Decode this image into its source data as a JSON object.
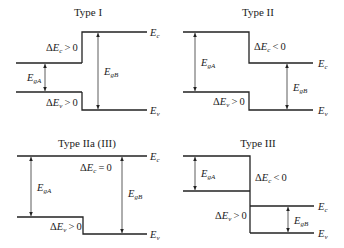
{
  "panels": [
    {
      "id": "type-i",
      "title": "Type I",
      "title_pos": [
        88,
        16
      ],
      "bands": [
        {
          "name": "ec-left",
          "points": [
            [
              16,
              63
            ],
            [
              82,
              63
            ]
          ]
        },
        {
          "name": "ec-step",
          "points": [
            [
              82,
              63
            ],
            [
              82,
              32
            ],
            [
              147,
              32
            ]
          ]
        },
        {
          "name": "ev-left",
          "points": [
            [
              16,
              92
            ],
            [
              82,
              92
            ]
          ]
        },
        {
          "name": "ev-step",
          "points": [
            [
              82,
              92
            ],
            [
              82,
              110
            ],
            [
              147,
              110
            ]
          ]
        }
      ],
      "arrows": [
        {
          "name": "egA-arrow",
          "x": 45,
          "y1": 63,
          "y2": 92,
          "label": "gA",
          "label_pos": [
            27,
            81
          ]
        },
        {
          "name": "egB-arrow",
          "x": 98,
          "y1": 32,
          "y2": 110,
          "label": "gB",
          "label_pos": [
            104,
            75
          ]
        }
      ],
      "deltas": [
        {
          "name": "delta-ec",
          "sym": "c",
          "rel": ">",
          "val": "0",
          "pos": [
            46,
            51
          ]
        },
        {
          "name": "delta-ev",
          "sym": "v",
          "rel": ">",
          "val": "0",
          "pos": [
            46,
            106
          ]
        }
      ],
      "edges": [
        {
          "sym": "c",
          "pos": [
            150,
            36
          ]
        },
        {
          "sym": "v",
          "pos": [
            150,
            114
          ]
        }
      ]
    },
    {
      "id": "type-ii",
      "title": "Type II",
      "title_pos": [
        258,
        16
      ],
      "bands": [
        {
          "name": "ec-step",
          "points": [
            [
              183,
              32
            ],
            [
              249,
              32
            ],
            [
              249,
              63
            ],
            [
              313,
              63
            ]
          ]
        },
        {
          "name": "ev-step",
          "points": [
            [
              183,
              92
            ],
            [
              249,
              92
            ],
            [
              249,
              110
            ],
            [
              313,
              110
            ]
          ]
        }
      ],
      "arrows": [
        {
          "name": "egA-arrow",
          "x": 195,
          "y1": 32,
          "y2": 92,
          "label": "gA",
          "label_pos": [
            201,
            66
          ]
        },
        {
          "name": "egB-arrow",
          "x": 287,
          "y1": 63,
          "y2": 110,
          "label": "gB",
          "label_pos": [
            293,
            91
          ]
        }
      ],
      "deltas": [
        {
          "name": "delta-ec",
          "sym": "c",
          "rel": "<",
          "val": "0",
          "pos": [
            254,
            50
          ]
        },
        {
          "name": "delta-ev",
          "sym": "v",
          "rel": ">",
          "val": "0",
          "pos": [
            213,
            105
          ]
        }
      ],
      "edges": [
        {
          "sym": "c",
          "pos": [
            318,
            67
          ]
        },
        {
          "sym": "v",
          "pos": [
            318,
            114
          ]
        }
      ]
    },
    {
      "id": "type-iia",
      "title": "Type IIa (III)",
      "title_pos": [
        87,
        147
      ],
      "bands": [
        {
          "name": "ec-flat",
          "points": [
            [
              17,
              156
            ],
            [
              147,
              156
            ]
          ]
        },
        {
          "name": "ev-step",
          "points": [
            [
              17,
              217
            ],
            [
              83,
              217
            ],
            [
              83,
              234
            ],
            [
              147,
              234
            ]
          ]
        }
      ],
      "arrows": [
        {
          "name": "egA-arrow",
          "x": 31,
          "y1": 156,
          "y2": 217,
          "label": "gA",
          "label_pos": [
            37,
            191
          ]
        },
        {
          "name": "egB-arrow",
          "x": 122,
          "y1": 156,
          "y2": 234,
          "label": "gB",
          "label_pos": [
            128,
            197
          ]
        }
      ],
      "deltas": [
        {
          "name": "delta-ec",
          "sym": "c",
          "rel": "=",
          "val": "0",
          "pos": [
            80,
            171
          ]
        },
        {
          "name": "delta-ev",
          "sym": "v",
          "rel": ">",
          "val": "0",
          "pos": [
            50,
            230
          ]
        }
      ],
      "edges": [
        {
          "sym": "c",
          "pos": [
            150,
            160
          ]
        },
        {
          "sym": "v",
          "pos": [
            150,
            238
          ]
        }
      ]
    },
    {
      "id": "type-iii",
      "title": "Type III",
      "title_pos": [
        258,
        147
      ],
      "bands": [
        {
          "name": "ec-left",
          "points": [
            [
              183,
              156
            ],
            [
              250,
              156
            ],
            [
              250,
              191
            ]
          ]
        },
        {
          "name": "ev-left",
          "points": [
            [
              183,
              191
            ],
            [
              250,
              191
            ]
          ]
        },
        {
          "name": "drop",
          "points": [
            [
              250,
              191
            ],
            [
              250,
              233
            ]
          ]
        },
        {
          "name": "ec-right",
          "points": [
            [
              250,
              206
            ],
            [
              314,
              206
            ]
          ]
        },
        {
          "name": "ev-right",
          "points": [
            [
              250,
              233
            ],
            [
              314,
              233
            ]
          ]
        }
      ],
      "arrows": [
        {
          "name": "egA-arrow",
          "x": 195,
          "y1": 156,
          "y2": 191,
          "label": "gA",
          "label_pos": [
            201,
            177
          ]
        },
        {
          "name": "egB-arrow",
          "x": 288,
          "y1": 206,
          "y2": 233,
          "label": "gB",
          "label_pos": [
            294,
            224
          ]
        }
      ],
      "deltas": [
        {
          "name": "delta-ec",
          "sym": "c",
          "rel": "<",
          "val": "0",
          "pos": [
            255,
            181
          ]
        },
        {
          "name": "delta-ev",
          "sym": "v",
          "rel": ">",
          "val": "0",
          "pos": [
            215,
            219
          ]
        }
      ],
      "edges": [
        {
          "sym": "c",
          "pos": [
            318,
            210
          ]
        },
        {
          "sym": "v",
          "pos": [
            318,
            237
          ]
        }
      ]
    }
  ]
}
